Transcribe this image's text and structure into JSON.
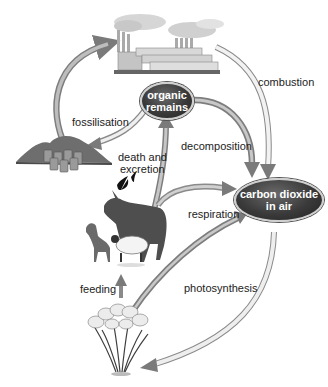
{
  "diagram": {
    "title_fragment": "",
    "type": "carbon-cycle",
    "nodes": {
      "organic_remains": "organic remains",
      "carbon_dioxide": "carbon dioxide in air"
    },
    "node_lines": {
      "organic_remains": [
        "organic",
        "remains"
      ],
      "carbon_dioxide": [
        "carbon dioxide",
        "in air"
      ]
    },
    "illustrations": [
      "factory",
      "fossil-fuel-deposits",
      "birds",
      "horse",
      "dog",
      "sheep",
      "plants"
    ],
    "process_labels": {
      "combustion": "combustion",
      "fossilisation": "fossilisation",
      "death_and_excretion_1": "death and",
      "death_and_excretion_2": "excretion",
      "decomposition": "decomposition",
      "respiration": "respiration",
      "feeding": "feeding",
      "photosynthesis": "photosynthesis"
    },
    "edges": [
      {
        "from": "fossil-fuel-deposits",
        "to": "factory",
        "label": ""
      },
      {
        "from": "factory",
        "to": "carbon dioxide in air",
        "label": "combustion"
      },
      {
        "from": "organic remains",
        "to": "fossil-fuel-deposits",
        "label": "fossilisation"
      },
      {
        "from": "animals",
        "to": "organic remains",
        "label": "death and excretion"
      },
      {
        "from": "organic remains",
        "to": "carbon dioxide in air",
        "label": "decomposition"
      },
      {
        "from": "animals",
        "to": "carbon dioxide in air",
        "label": "respiration"
      },
      {
        "from": "plants",
        "to": "animals",
        "label": "feeding"
      },
      {
        "from": "plants",
        "to": "carbon dioxide in air",
        "label": ""
      },
      {
        "from": "carbon dioxide in air",
        "to": "plants",
        "label": "photosynthesis"
      }
    ],
    "colors": {
      "node_fill": "#3a3a3a",
      "node_text": "#ffffff",
      "arrow_solid": "#8a8a8a",
      "arrow_hollow": "#e6e6e6",
      "text": "#222222"
    }
  }
}
